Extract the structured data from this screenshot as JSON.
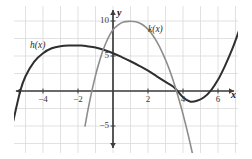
{
  "figure": {
    "background": "#ffffff",
    "plot_background": "#ffffff",
    "grid_color": "#d9d9d9",
    "axis_color": "#3d3d3d"
  },
  "axis_labels": {
    "x": "x",
    "y": "y"
  },
  "curve_labels": {
    "h": "h(x)",
    "k": "k(x)"
  },
  "x_ticks": [
    {
      "value": -4,
      "label": "−4"
    },
    {
      "value": -2,
      "label": "−2"
    },
    {
      "value": 2,
      "label": "2"
    },
    {
      "value": 4,
      "label": "4"
    },
    {
      "value": 6,
      "label": "6"
    }
  ],
  "y_ticks": [
    {
      "value": 10,
      "label": "10"
    },
    {
      "value": 5,
      "label": "5"
    },
    {
      "value": -5,
      "label": "−5"
    }
  ],
  "chart_data": {
    "type": "line",
    "title": "",
    "xlabel": "x",
    "ylabel": "y",
    "xlim": [
      -5.7,
      7.6
    ],
    "ylim": [
      -9.7,
      12.3
    ],
    "grid": true,
    "grid_spacing_x": 1,
    "grid_spacing_y": 2.5,
    "legend": "inline-curve-labels",
    "xticks": [
      -4,
      -2,
      2,
      4,
      6
    ],
    "yticks": [
      10,
      5,
      -5
    ],
    "series": [
      {
        "name": "h(x)",
        "color": "#2f2f2f",
        "width": 2.0,
        "type": "cubic",
        "description": "Cubic rising from lower left, local maximum near (-1.8, 6.5), local minimum near (4.4, -1.5), rising steeply at right edge",
        "x_intercepts": [
          -5.3
        ],
        "y_intercept": 5.4,
        "local_max": [
          -1.8,
          6.5
        ],
        "local_min": [
          4.4,
          -1.5
        ],
        "points": [
          [
            -5.7,
            -4.3
          ],
          [
            -5.3,
            0.0
          ],
          [
            -5.0,
            2.1
          ],
          [
            -4.5,
            4.2
          ],
          [
            -4.0,
            5.4
          ],
          [
            -3.5,
            6.1
          ],
          [
            -3.0,
            6.4
          ],
          [
            -2.5,
            6.5
          ],
          [
            -2.0,
            6.5
          ],
          [
            -1.8,
            6.5
          ],
          [
            -1.5,
            6.4
          ],
          [
            -1.0,
            6.2
          ],
          [
            -0.5,
            5.85
          ],
          [
            0.0,
            5.4
          ],
          [
            0.5,
            4.85
          ],
          [
            1.0,
            4.25
          ],
          [
            1.5,
            3.6
          ],
          [
            2.0,
            2.9
          ],
          [
            2.5,
            2.1
          ],
          [
            3.0,
            1.3
          ],
          [
            3.5,
            0.5
          ],
          [
            4.0,
            -0.9
          ],
          [
            4.4,
            -1.5
          ],
          [
            4.8,
            -1.4
          ],
          [
            5.2,
            -0.9
          ],
          [
            5.6,
            0.1
          ],
          [
            6.0,
            1.6
          ],
          [
            6.4,
            3.6
          ],
          [
            6.8,
            5.9
          ],
          [
            7.2,
            8.6
          ],
          [
            7.55,
            11.0
          ]
        ]
      },
      {
        "name": "k(x)",
        "color": "#8d8d8d",
        "width": 1.6,
        "type": "parabola",
        "description": "Downward-opening parabola, vertex near (1.3, 9.5), roots near x = -0.85 and x = 3.4",
        "vertex": [
          1.3,
          9.5
        ],
        "x_intercepts": [
          -0.85,
          3.4
        ],
        "y_intercept": 5.8,
        "points": [
          [
            -1.6,
            -5.0
          ],
          [
            -1.4,
            -2.3
          ],
          [
            -1.2,
            0.1
          ],
          [
            -1.0,
            2.2
          ],
          [
            -0.85,
            3.6
          ],
          [
            -0.6,
            5.6
          ],
          [
            -0.4,
            6.9
          ],
          [
            -0.2,
            7.95
          ],
          [
            0.0,
            8.75
          ],
          [
            0.3,
            9.45
          ],
          [
            0.6,
            9.85
          ],
          [
            0.9,
            9.95
          ],
          [
            1.3,
            9.9
          ],
          [
            1.6,
            9.6
          ],
          [
            1.9,
            9.05
          ],
          [
            2.2,
            8.2
          ],
          [
            2.5,
            7.05
          ],
          [
            2.8,
            5.6
          ],
          [
            3.1,
            3.85
          ],
          [
            3.4,
            1.8
          ],
          [
            3.7,
            -0.6
          ],
          [
            4.0,
            -3.3
          ],
          [
            4.3,
            -6.3
          ],
          [
            4.6,
            -9.6
          ]
        ]
      }
    ]
  }
}
